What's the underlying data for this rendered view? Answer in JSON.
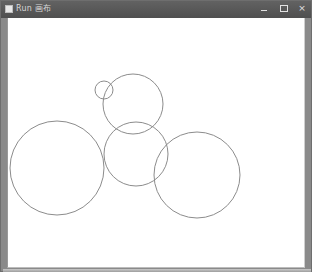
{
  "window": {
    "title": "Run 画布",
    "controls": {
      "minimize": "minimize",
      "maximize": "maximize",
      "close": "×"
    },
    "colors": {
      "titlebar": "#575757",
      "client_bg": "#ffffff",
      "circle_stroke": "#8c8c8c"
    }
  },
  "canvas": {
    "circles": [
      {
        "name": "small-circle",
        "cx": 96,
        "cy": 72,
        "r": 9
      },
      {
        "name": "upper-medium-circle",
        "cx": 125,
        "cy": 86,
        "r": 30
      },
      {
        "name": "left-large-circle",
        "cx": 49,
        "cy": 150,
        "r": 47
      },
      {
        "name": "middle-circle",
        "cx": 128,
        "cy": 136,
        "r": 32
      },
      {
        "name": "right-circle",
        "cx": 189,
        "cy": 157,
        "r": 43
      }
    ]
  }
}
